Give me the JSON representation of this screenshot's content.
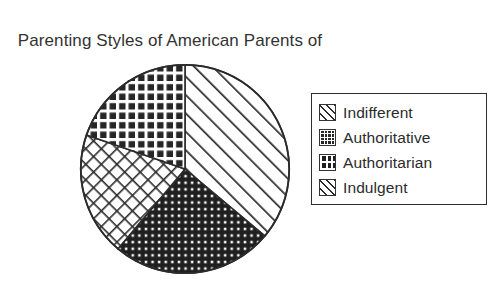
{
  "chart_data": {
    "type": "pie",
    "title": "Parenting Styles of American Parents of Adolescents",
    "title_line1": "Parenting Styles of American Parents of",
    "title_line2": "Adolescents",
    "xlabel": "",
    "ylabel": "",
    "legend_position": "right",
    "grid": false,
    "start_angle_deg": 0,
    "direction": "clockwise",
    "categories": [
      "Indifferent",
      "Authoritative",
      "Authoritarian",
      "Indulgent"
    ],
    "values": [
      36,
      20,
      25,
      19
    ],
    "slices": [
      {
        "label": "Indifferent",
        "value": 36,
        "start_angle_deg": 0,
        "end_angle_deg": 130,
        "pattern": "diagonal-stripes",
        "fill": "#ffffff",
        "stroke": "#2b2b2b"
      },
      {
        "label": "Authoritarian",
        "value": 25,
        "start_angle_deg": 130,
        "end_angle_deg": 220,
        "pattern": "dark-dot-grid",
        "fill": "#1f1f1f",
        "stroke": "#2b2b2b"
      },
      {
        "label": "Indulgent",
        "value": 19,
        "start_angle_deg": 220,
        "end_angle_deg": 289,
        "pattern": "cross-hatch",
        "fill": "#ffffff",
        "stroke": "#2b2b2b"
      },
      {
        "label": "Authoritative",
        "value": 20,
        "start_angle_deg": 289,
        "end_angle_deg": 360,
        "pattern": "dark-checker-grid",
        "fill": "#262626",
        "stroke": "#2b2b2b"
      }
    ]
  },
  "legend": {
    "items": [
      {
        "label": "Indifferent",
        "pattern": "diagonal-stripes",
        "swatch_icon": "diagonal-stripe-swatch-icon"
      },
      {
        "label": "Authoritative",
        "pattern": "dark-checker-grid",
        "swatch_icon": "dark-checker-swatch-icon"
      },
      {
        "label": "Authoritarian",
        "pattern": "dark-dot-grid",
        "swatch_icon": "dark-dot-swatch-icon"
      },
      {
        "label": "Indulgent",
        "pattern": "cross-hatch",
        "swatch_icon": "cross-hatch-swatch-icon"
      }
    ]
  },
  "colors": {
    "ink": "#2b2b2b",
    "background": "#ffffff",
    "dark_fill": "#1f1f1f",
    "legend_border": "#2f2f2f"
  }
}
